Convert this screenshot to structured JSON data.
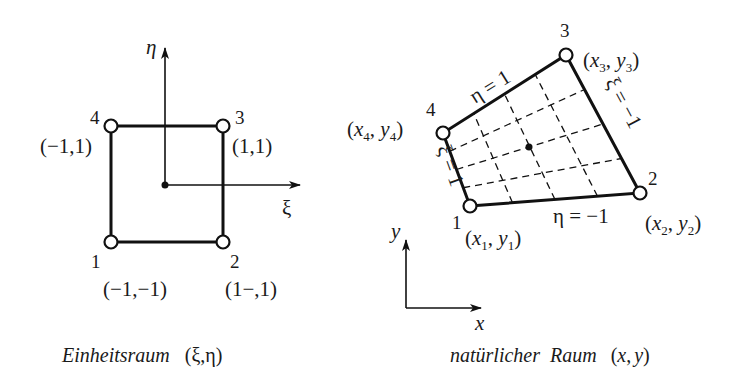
{
  "left_diagram": {
    "title": "Einheitsraum",
    "title_coords": "(ξ,η)",
    "axis_xi_label": "ξ",
    "axis_eta_label": "η",
    "nodes": [
      {
        "id": "1",
        "coords": "(−1,−1)"
      },
      {
        "id": "2",
        "coords": "(1−,1)"
      },
      {
        "id": "3",
        "coords": "(1,1)"
      },
      {
        "id": "4",
        "coords": "(−1,1)"
      }
    ]
  },
  "right_diagram": {
    "title": "natürlicher  Raum",
    "title_coords_open": "(",
    "title_coords_x": "x",
    "title_coords_sep": ",",
    "title_coords_y": "y",
    "title_coords_close": ")",
    "axis_x_label": "x",
    "axis_y_label": "y",
    "nodes": [
      {
        "id": "1",
        "x": "x",
        "xsub": "1",
        "y": "y",
        "ysub": "1"
      },
      {
        "id": "2",
        "x": "x",
        "xsub": "2",
        "y": "y",
        "ysub": "2"
      },
      {
        "id": "3",
        "x": "x",
        "xsub": "3",
        "y": "y",
        "ysub": "3"
      },
      {
        "id": "4",
        "x": "x",
        "xsub": "4",
        "y": "y",
        "ysub": "4"
      }
    ],
    "edge_labels": {
      "top": "η = 1",
      "bottom": "η = −1",
      "left": "ξ = 1",
      "right": "ξ = −1"
    }
  }
}
